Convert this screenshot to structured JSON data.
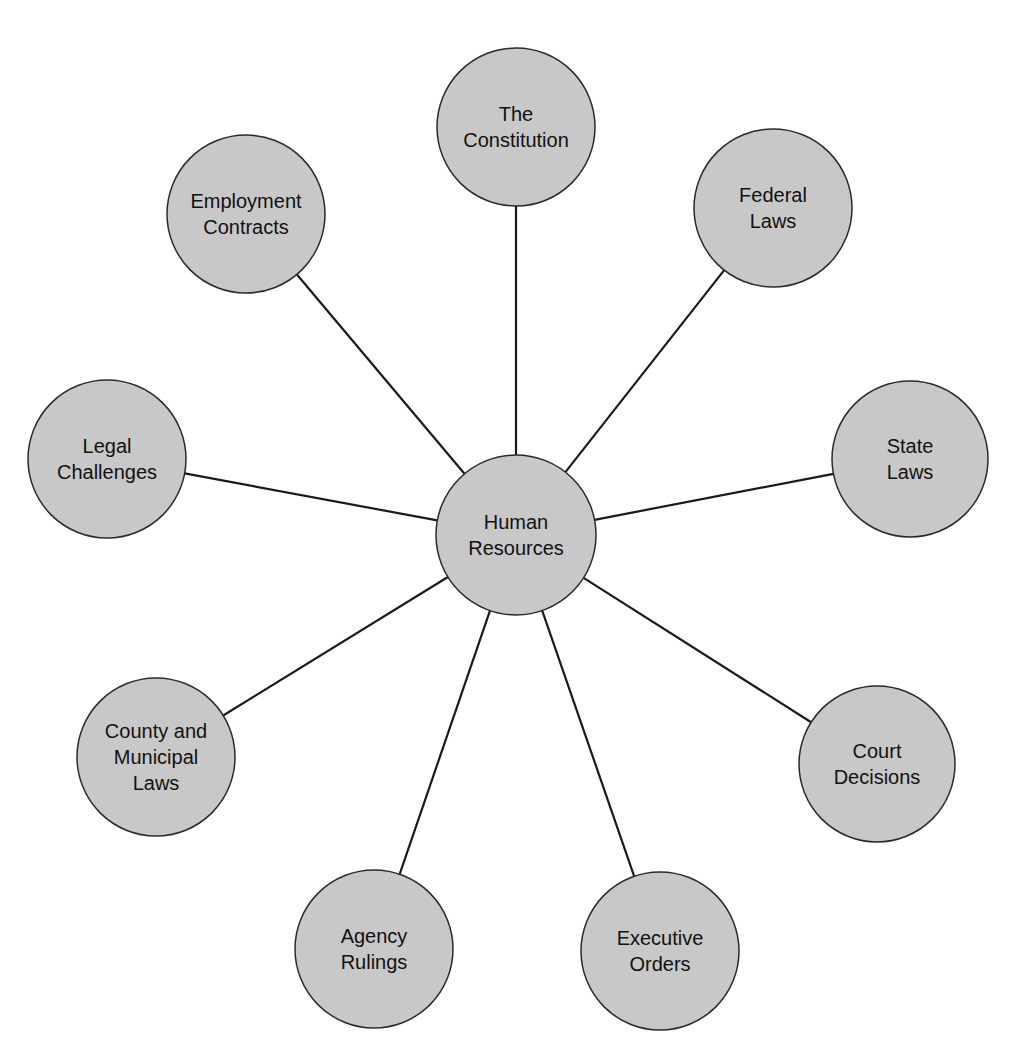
{
  "diagram": {
    "type": "hub-and-spoke",
    "colors": {
      "background": "#ffffff",
      "node_fill": "#c8c8c8",
      "node_stroke": "#2a2a2a",
      "connector": "#1a1a1a",
      "text": "#111111"
    },
    "hub": {
      "id": "human-resources",
      "lines": [
        "Human",
        "Resources"
      ],
      "cx": 516,
      "cy": 535,
      "r": 80
    },
    "spokes": [
      {
        "id": "the-constitution",
        "lines": [
          "The",
          "Constitution"
        ],
        "cx": 516,
        "cy": 127,
        "r": 79
      },
      {
        "id": "federal-laws",
        "lines": [
          "Federal",
          "Laws"
        ],
        "cx": 773,
        "cy": 208,
        "r": 79
      },
      {
        "id": "state-laws",
        "lines": [
          "State",
          "Laws"
        ],
        "cx": 910,
        "cy": 459,
        "r": 78
      },
      {
        "id": "court-decisions",
        "lines": [
          "Court",
          "Decisions"
        ],
        "cx": 877,
        "cy": 764,
        "r": 78
      },
      {
        "id": "executive-orders",
        "lines": [
          "Executive",
          "Orders"
        ],
        "cx": 660,
        "cy": 951,
        "r": 79
      },
      {
        "id": "agency-rulings",
        "lines": [
          "Agency",
          "Rulings"
        ],
        "cx": 374,
        "cy": 949,
        "r": 79
      },
      {
        "id": "county-and-municipal-laws",
        "lines": [
          "County and",
          "Municipal",
          "Laws"
        ],
        "cx": 156,
        "cy": 757,
        "r": 79
      },
      {
        "id": "legal-challenges",
        "lines": [
          "Legal",
          "Challenges"
        ],
        "cx": 107,
        "cy": 459,
        "r": 79
      },
      {
        "id": "employment-contracts",
        "lines": [
          "Employment",
          "Contracts"
        ],
        "cx": 246,
        "cy": 214,
        "r": 79
      }
    ]
  }
}
